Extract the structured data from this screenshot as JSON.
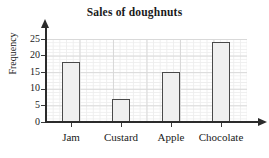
{
  "chart_data": {
    "type": "bar",
    "title": "Sales of doughnuts",
    "xlabel": "",
    "ylabel": "Frequency",
    "categories": [
      "Jam",
      "Custard",
      "Apple",
      "Chocolate"
    ],
    "values": [
      18,
      7,
      15,
      24
    ],
    "ylim": [
      0,
      25
    ],
    "yticks": [
      0,
      5,
      10,
      15,
      20,
      25
    ],
    "ytick_labels": [
      "0",
      "5",
      "10",
      "15",
      "20",
      "25"
    ],
    "grid": true,
    "grid_minor": true,
    "legend": false,
    "legend_position": "none",
    "bar_fill_color": "#f0f0f0",
    "bar_edge_color": "#4a4a4a",
    "axis_color": "#2b2b2b",
    "grid_major_color": "#d9d9d9",
    "grid_minor_color": "#eeeeee",
    "text_color": "#1a1a1a",
    "background_color": "#ffffff",
    "axis_arrows": true
  }
}
